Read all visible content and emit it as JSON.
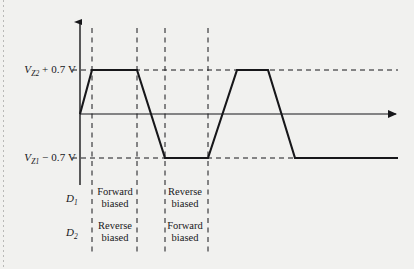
{
  "figure": {
    "background_color": "#f1f1ef",
    "line_color": "#17171a"
  },
  "axes": {
    "y_axis_name": "voltage-axis",
    "x_axis_name": "time-axis",
    "origin_x": 80,
    "origin_y": 114,
    "x_arrow_x": 400,
    "y_arrow_y": 20
  },
  "levels": [
    {
      "id": "upper",
      "label_prefix": "V",
      "label_sub": "Z2",
      "label_suffix": " + 0.7 V",
      "label_full": "VZ2 + 0.7 V",
      "y": 70,
      "dash_end_x": 398
    },
    {
      "id": "lower",
      "label_prefix": "V",
      "label_sub": "Z1",
      "label_suffix": " − 0.7 V",
      "label_full": "VZ1 − 0.7 V",
      "y": 158,
      "dash_end_x": 398
    }
  ],
  "dividers": {
    "name": "region-dividers",
    "x_positions": [
      92,
      137,
      165,
      208
    ],
    "top_y": 28,
    "bottom_y": 255
  },
  "diodes": [
    {
      "symbol": "D",
      "sub": "1",
      "label": "D1",
      "regions": [
        {
          "line1": "Forward",
          "line2": "biased"
        },
        {
          "line1": "Reverse",
          "line2": "biased"
        }
      ]
    },
    {
      "symbol": "D",
      "sub": "2",
      "label": "D2",
      "regions": [
        {
          "line1": "Reverse",
          "line2": "biased"
        },
        {
          "line1": "Forward",
          "line2": "biased"
        }
      ]
    }
  ],
  "chart_data": {
    "type": "line",
    "xlabel": "",
    "ylabel": "",
    "grid": false,
    "legend": null,
    "y_tick_labels": [
      "VZ2 + 0.7 V",
      "VZ1 − 0.7 V"
    ],
    "y_tick_pixels": [
      70,
      158
    ],
    "zero_pixel_y": 114,
    "series": [
      {
        "name": "output-voltage",
        "stroke_width": 2,
        "points": [
          [
            80,
            114
          ],
          [
            92,
            70
          ],
          [
            137,
            70
          ],
          [
            165,
            158
          ],
          [
            208,
            158
          ],
          [
            237,
            70
          ],
          [
            268,
            70
          ],
          [
            295,
            158
          ],
          [
            398,
            158
          ]
        ]
      }
    ],
    "annotations": [
      {
        "text": "Forward biased",
        "row": "D1",
        "region": 1
      },
      {
        "text": "Reverse biased",
        "row": "D1",
        "region": 2
      },
      {
        "text": "Reverse biased",
        "row": "D2",
        "region": 1
      },
      {
        "text": "Forward biased",
        "row": "D2",
        "region": 2
      }
    ]
  }
}
